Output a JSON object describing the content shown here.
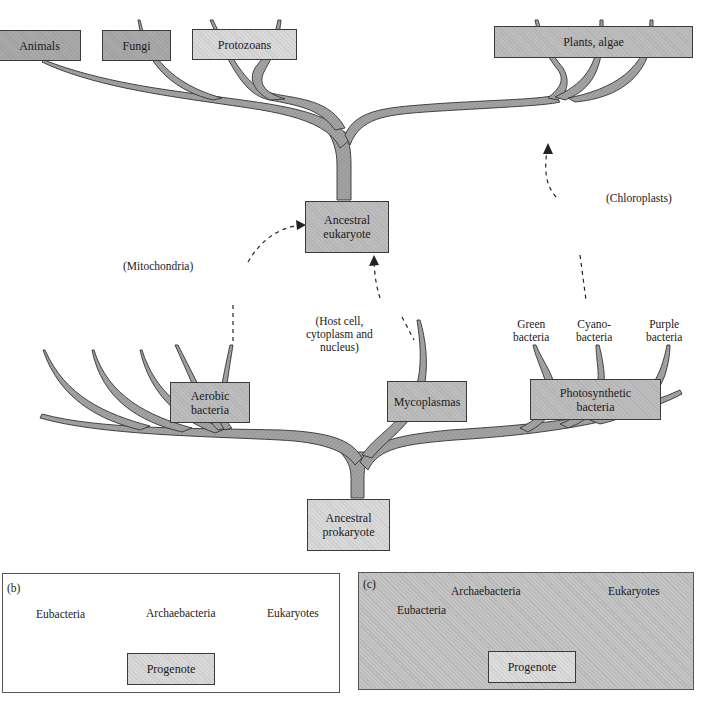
{
  "figure": {
    "panel_a": {
      "top_groups": [
        "Animals",
        "Fungi",
        "Protozoans",
        "Plants, algae"
      ],
      "ancestral_eukaryote": [
        "Ancestral",
        "eukaryote"
      ],
      "endosymbiosis_labels": {
        "mitochondria": "(Mitochondria)",
        "chloroplasts": "(Chloroplasts)",
        "host_cell": [
          "(Host cell,",
          "cytoplasm and",
          "nucleus)"
        ]
      },
      "bacteria_labels": {
        "green": [
          "Green",
          "bacteria"
        ],
        "cyano": [
          "Cyano-",
          "bacteria"
        ],
        "purple": [
          "Purple",
          "bacteria"
        ]
      },
      "prokaryote_groups": {
        "aerobic": [
          "Aerobic",
          "bacteria"
        ],
        "mycoplasmas": "Mycoplasmas",
        "photosynthetic": [
          "Photosynthetic",
          "bacteria"
        ]
      },
      "ancestral_prokaryote": [
        "Ancestral",
        "prokaryote"
      ]
    },
    "panel_b": {
      "tag": "(b)",
      "leaves": [
        "Eubacteria",
        "Archaebacteria",
        "Eukaryotes"
      ],
      "root": "Progenote"
    },
    "panel_c": {
      "tag": "(c)",
      "leaves": [
        "Eubacteria",
        "Archaebacteria",
        "Eukaryotes"
      ],
      "root": "Progenote"
    },
    "colors": {
      "branch_fill": "#9e9e9e",
      "branch_stroke": "#333333",
      "box_dark": "#a9a9a9",
      "box_mid": "#bdbdbd",
      "box_light": "#d9d9d9",
      "panel_c_bg": "#c4c4c4"
    }
  }
}
